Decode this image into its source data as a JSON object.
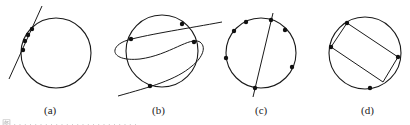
{
  "panels": [
    {
      "id": "a",
      "label": "(a)",
      "circle": {
        "cx": 56,
        "cy": 53,
        "r": 35
      },
      "lines": [
        [
          [
            42,
            6
          ],
          [
            9,
            79
          ]
        ]
      ],
      "points": [
        [
          32,
          29
        ],
        [
          28,
          35
        ],
        [
          25,
          41
        ],
        [
          23,
          50
        ]
      ],
      "label_pos": [
        44,
        104
      ]
    },
    {
      "id": "b",
      "label": "(b)",
      "circle": {
        "cx": 162,
        "cy": 51,
        "r": 36
      },
      "curve": "M 222 22 C 190 28, 150 34, 128 40 C 108 46, 110 62, 140 59 C 170 55, 190 36, 200 42 C 208 48, 200 60, 192 66 C 176 80, 150 87, 118 96",
      "points": [
        [
          131,
          39
        ],
        [
          182,
          24
        ],
        [
          194,
          42
        ],
        [
          150,
          86
        ]
      ],
      "label_pos": [
        152,
        104
      ]
    },
    {
      "id": "c",
      "label": "(c)",
      "circle": {
        "cx": 261,
        "cy": 53,
        "r": 35
      },
      "lines": [
        [
          [
            273,
            13
          ],
          [
            253,
            97
          ]
        ]
      ],
      "points": [
        [
          246,
          22
        ],
        [
          234,
          31
        ],
        [
          271,
          20
        ],
        [
          285,
          30
        ],
        [
          226,
          58
        ],
        [
          292,
          67
        ],
        [
          255,
          88
        ]
      ],
      "label_pos": [
        255,
        104
      ]
    },
    {
      "id": "d",
      "label": "(d)",
      "circle": {
        "cx": 365,
        "cy": 53,
        "r": 36
      },
      "polygon": [
        [
          347,
          23
        ],
        [
          398,
          57
        ],
        [
          383,
          82
        ],
        [
          331,
          47
        ]
      ],
      "points": [
        [
          347,
          23
        ],
        [
          331,
          47
        ],
        [
          398,
          57
        ],
        [
          370,
          88
        ]
      ],
      "label_pos": [
        361,
        104
      ]
    }
  ],
  "caption": "图 · · · · · · · · · · · · · · · · · · · · · · · ·",
  "style": {
    "stroke": "#1a1a1a",
    "point_fill": "#111111",
    "background": "#ffffff"
  }
}
